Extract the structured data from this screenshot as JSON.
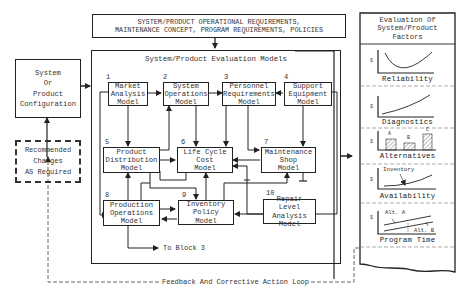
{
  "requirements_box": {
    "line1": "SYSTEM/PRODUCT OPERATIONAL REQUIREMENTS,",
    "line2": "MAINTENANCE CONCEPT, PROGRAM REQUIREMENTS, POLICIES"
  },
  "configuration_box": {
    "text": "System\nOr\nProduct\nConfiguration"
  },
  "changes_box": {
    "text": "Recommended\nChanges\nAS Required"
  },
  "models_panel": {
    "title": "System/Product Evaluation Models",
    "models": [
      {
        "num": "1",
        "label": "Market\nAnalysis\nModel"
      },
      {
        "num": "2",
        "label": "System\nOperations\nModel"
      },
      {
        "num": "3",
        "label": "Personnel\nRequirements\nModel"
      },
      {
        "num": "4",
        "label": "Support\nEquipment\nModel"
      },
      {
        "num": "5",
        "label": "Product\nDistribution\nModel"
      },
      {
        "num": "6",
        "label": "Life Cycle\nCost\nModel"
      },
      {
        "num": "7",
        "label": "Maintenance\nShop\nModel"
      },
      {
        "num": "8",
        "label": "Production\nOperations\nModel"
      },
      {
        "num": "9",
        "label": "Inventory\nPolicy\nModel"
      },
      {
        "num": "10",
        "label": "Repair Level\nAnalysis\nModel"
      }
    ],
    "to_block": "To Block 3"
  },
  "evaluation_panel": {
    "title": "Evaluation Of\nSystem/Product\nFactors",
    "axis_symbol": "$",
    "factors": [
      {
        "label": "Reliability"
      },
      {
        "label": "Diagnostics"
      },
      {
        "label": "Alternatives",
        "bars": [
          "A",
          "B",
          "C"
        ]
      },
      {
        "label": "Availability",
        "annotation": "Inventory"
      },
      {
        "label": "Program Time",
        "annotations": [
          "Alt. A",
          "Alt. B"
        ]
      }
    ]
  },
  "feedback_loop": {
    "label": "Feedback And Corrective Action Loop"
  }
}
